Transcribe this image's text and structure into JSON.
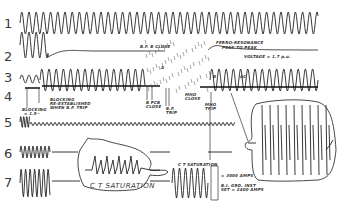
{
  "figure": {
    "type": "oscillogram",
    "ink_color": "#222222",
    "background": "#ffffff",
    "traces": [
      {
        "id": 1,
        "label": "1"
      },
      {
        "id": 2,
        "label": "2"
      },
      {
        "id": 3,
        "label": "3"
      },
      {
        "id": 4,
        "label": "4"
      },
      {
        "id": 5,
        "label": "5"
      },
      {
        "id": 6,
        "label": "6"
      },
      {
        "id": 7,
        "label": "7"
      }
    ],
    "annotations": {
      "bf_b_close": "B.F. B CLOSE",
      "ferro_resonance": "FERRO-RESONANCE",
      "peak_to_peak": "PEAK TO PEAK",
      "voltage": "VOLTAGE = 1.7 p.u.",
      "blocking": "BLOCKING",
      "blocking_reestablished": "BLOCKING",
      "reestablished_line2": "RE-ESTABLISHED",
      "reestablished_line3": "WHEN B.F. TRIP",
      "blocking_time": "= 1.5~",
      "b_pcb_close": "B PCB",
      "b_pcb_close2": "CLOSE",
      "bf_trip": "B.F.",
      "bf_trip2": "TRIP",
      "mho_close": "MHO",
      "mho_close2": "CLOSE",
      "mho_trip": "MHO",
      "mho_trip2": "TRIP",
      "ct_saturation_big": "C T SATURATION",
      "ct_saturation_small": "C T SATURATION",
      "amps_3000": "= 3000 AMPS",
      "ground_inst": "B.I. GRD. INST",
      "set_amps": "SET = 2400 AMPS",
      "mark_a": "A",
      "mark_b": "B",
      "mark_c": "AC"
    }
  }
}
